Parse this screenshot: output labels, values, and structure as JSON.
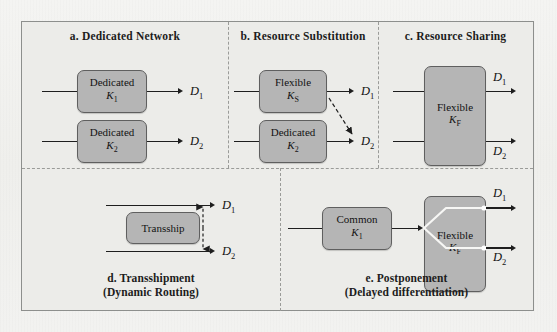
{
  "figure": {
    "background_color": "#ecece9",
    "box_fill": "#b5b5b5",
    "box_stroke": "#5f5f5f",
    "line_color": "#1e1e1e",
    "divider_color": "#9a9b98"
  },
  "panels": [
    {
      "id": "a",
      "title": "a. Dedicated Network",
      "boxes": [
        {
          "name": "dedicated-k1",
          "line1": "Dedicated",
          "symbol": "K",
          "subscript": "1"
        },
        {
          "name": "dedicated-k2",
          "line1": "Dedicated",
          "symbol": "K",
          "subscript": "2"
        }
      ],
      "outputs": [
        {
          "label": "D",
          "subscript": "1"
        },
        {
          "label": "D",
          "subscript": "2"
        }
      ]
    },
    {
      "id": "b",
      "title": "b. Resource Substitution",
      "boxes": [
        {
          "name": "flexible-ks",
          "line1": "Flexible",
          "symbol": "K",
          "subscript": "S"
        },
        {
          "name": "dedicated-k2",
          "line1": "Dedicated",
          "symbol": "K",
          "subscript": "2"
        }
      ],
      "outputs": [
        {
          "label": "D",
          "subscript": "1"
        },
        {
          "label": "D",
          "subscript": "2"
        }
      ],
      "substitution_arrow": "dashed diagonal from Flexible K_S toward D_2"
    },
    {
      "id": "c",
      "title": "c. Resource Sharing",
      "boxes": [
        {
          "name": "flexible-kf",
          "line1": "Flexible",
          "symbol": "K",
          "subscript": "F"
        }
      ],
      "outputs": [
        {
          "label": "D",
          "subscript": "1"
        },
        {
          "label": "D",
          "subscript": "2"
        }
      ]
    },
    {
      "id": "d",
      "caption_line1": "d. Transshipment",
      "caption_line2": "(Dynamic Routing)",
      "boxes": [
        {
          "name": "transship",
          "line1": "Transship"
        }
      ],
      "outputs": [
        {
          "label": "D",
          "subscript": "1"
        },
        {
          "label": "D",
          "subscript": "2"
        }
      ],
      "transship_arrow": "dashed vertical double-headed arrow between the two routes"
    },
    {
      "id": "e",
      "caption_line1": "e. Postponement",
      "caption_line2": "(Delayed differentiation)",
      "boxes": [
        {
          "name": "common-k1",
          "line1": "Common",
          "symbol": "K",
          "subscript": "1"
        },
        {
          "name": "flexible-kf",
          "line1": "Flexible",
          "symbol": "K",
          "subscript": "F"
        }
      ],
      "outputs": [
        {
          "label": "D",
          "subscript": "1"
        },
        {
          "label": "D",
          "subscript": "2"
        }
      ],
      "fork": "white branching fork inside Flexible K_F splitting to D_1 and D_2"
    }
  ]
}
